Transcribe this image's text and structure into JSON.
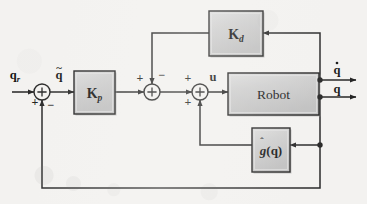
{
  "figure": {
    "kind": "control-block-diagram",
    "background_color": "#f3f2f0",
    "line_color": "#1a1a1a",
    "block_fill": "#c8c8c8",
    "block_stroke": "#141414",
    "block_highlight": "#e2e2e2",
    "block_shadow": "#8f8f8f"
  },
  "blocks": [
    {
      "id": "kd",
      "label": "K",
      "sub": "d",
      "name": "Kd gain block",
      "x": 209,
      "y": 11,
      "w": 54,
      "h": 45
    },
    {
      "id": "kp",
      "label": "K",
      "sub": "p",
      "name": "Kp gain block",
      "x": 74,
      "y": 71,
      "w": 41,
      "h": 43
    },
    {
      "id": "robot",
      "label": "Robot",
      "sub": "",
      "name": "Robot plant block",
      "x": 228,
      "y": 73,
      "w": 91,
      "h": 42
    },
    {
      "id": "ghat",
      "label": "g(q)",
      "sub": "",
      "name": "gravity compensation block",
      "x": 252,
      "y": 128,
      "w": 38,
      "h": 44
    }
  ],
  "summers": [
    {
      "id": "sum1",
      "name": "error summing junction",
      "cx": 42,
      "cy": 92,
      "r": 8
    },
    {
      "id": "sum2",
      "name": "velocity damping summing junction",
      "cx": 152,
      "cy": 92,
      "r": 8
    },
    {
      "id": "sum3",
      "name": "torque summing junction",
      "cx": 200,
      "cy": 92,
      "r": 8
    }
  ],
  "signs": [
    {
      "for": "sum1",
      "text": "+",
      "x": 35,
      "y": 106,
      "name": "sum1-plus-sign"
    },
    {
      "for": "sum1",
      "text": "−",
      "x": 51,
      "y": 109,
      "name": "sum1-minus-sign"
    },
    {
      "for": "sum2",
      "text": "+",
      "x": 140,
      "y": 82,
      "name": "sum2-plus-sign"
    },
    {
      "for": "sum2",
      "text": "−",
      "x": 162,
      "y": 79,
      "name": "sum2-minus-sign"
    },
    {
      "for": "sum3",
      "text": "+",
      "x": 188,
      "y": 82,
      "name": "sum3-plus-sign-top"
    },
    {
      "for": "sum3",
      "text": "+",
      "x": 188,
      "y": 106,
      "name": "sum3-plus-sign-bottom"
    }
  ],
  "signals": [
    {
      "id": "qr",
      "text": "q",
      "sub": "r",
      "accent": "none",
      "x": 15,
      "y": 79,
      "name": "reference-input-label"
    },
    {
      "id": "qtil",
      "text": "q",
      "sub": "",
      "accent": "tilde",
      "x": 59,
      "y": 79,
      "name": "position-error-label"
    },
    {
      "id": "u",
      "text": "u",
      "sub": "",
      "accent": "none",
      "x": 213,
      "y": 81,
      "name": "control-torque-label"
    },
    {
      "id": "qdot",
      "text": "q",
      "sub": "",
      "accent": "dot",
      "x": 337,
      "y": 74,
      "name": "joint-velocity-output-label"
    },
    {
      "id": "qout",
      "text": "q",
      "sub": "",
      "accent": "none",
      "x": 337,
      "y": 93,
      "name": "joint-position-output-label"
    }
  ],
  "junction_dots": [
    {
      "cx": 320,
      "cy": 80,
      "name": "velocity-tap-dot"
    },
    {
      "cx": 320,
      "cy": 97,
      "name": "position-tap-dot"
    },
    {
      "cx": 320,
      "cy": 145,
      "name": "gravity-feedback-tap-dot"
    }
  ],
  "wires": [
    {
      "name": "reference-to-sum1",
      "d": "M 12 92 L 34 92",
      "arrow": "end"
    },
    {
      "name": "sum1-to-kp",
      "d": "M 50 92 L 74 92",
      "arrow": "end"
    },
    {
      "name": "kp-to-sum2",
      "d": "M 115 92 L 144 92",
      "arrow": "end"
    },
    {
      "name": "sum2-to-sum3",
      "d": "M 160 92 L 192 92",
      "arrow": "end"
    },
    {
      "name": "sum3-to-robot",
      "d": "M 208 92 L 228 92",
      "arrow": "end"
    },
    {
      "name": "robot-velocity-output",
      "d": "M 319 80 L 356 80",
      "arrow": "end"
    },
    {
      "name": "robot-position-output",
      "d": "M 319 97 L 356 97",
      "arrow": "end"
    },
    {
      "name": "velocity-to-kd",
      "d": "M 320 80 L 320 33 L 263 33",
      "arrow": "end"
    },
    {
      "name": "kd-to-sum2",
      "d": "M 209 33 L 152 33 L 152 84",
      "arrow": "end"
    },
    {
      "name": "position-to-ghat",
      "d": "M 320 97 L 320 145 L 290 145",
      "arrow": "end"
    },
    {
      "name": "ghat-to-sum3",
      "d": "M 252 145 L 200 145 L 200 100",
      "arrow": "end"
    },
    {
      "name": "outer-position-feedback",
      "d": "M 320 145 L 320 188 L 42 188 L 42 100",
      "arrow": "end"
    }
  ]
}
